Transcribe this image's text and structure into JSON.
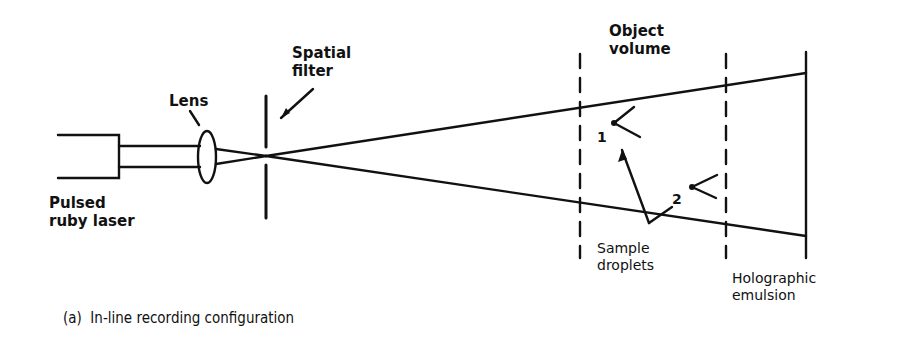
{
  "diagram": {
    "labels": {
      "spatial_filter": "Spatial\nfilter",
      "lens": "Lens",
      "object_volume": "Object\nvolume",
      "laser": "Pulsed\nruby laser",
      "sample_droplets": "Sample\ndroplets",
      "holographic_emulsion": "Holographic\nemulsion",
      "droplet_1": "1",
      "droplet_2": "2"
    },
    "caption": "(a)  In-line recording configuration",
    "colors": {
      "line": "#111111",
      "background": "#ffffff"
    }
  }
}
